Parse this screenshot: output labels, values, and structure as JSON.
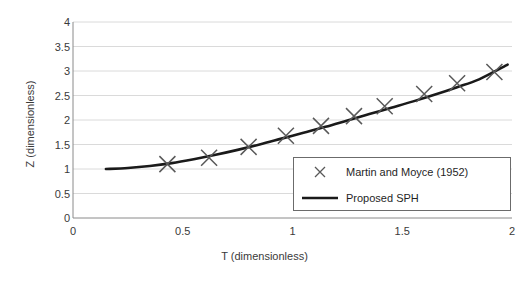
{
  "chart_data": {
    "type": "scatter",
    "title": "",
    "xlabel": "T (dimensionless)",
    "ylabel": "Z (dimensionless)",
    "xlim": [
      0,
      2
    ],
    "ylim": [
      0,
      4
    ],
    "xticks": [
      "0",
      "0.5",
      "1",
      "1.5",
      "2"
    ],
    "xtick_values": [
      0,
      0.5,
      1,
      1.5,
      2
    ],
    "yticks": [
      "0",
      "0.5",
      "1",
      "1.5",
      "2",
      "2.5",
      "3",
      "3.5",
      "4"
    ],
    "ytick_values": [
      0,
      0.5,
      1,
      1.5,
      2,
      2.5,
      3,
      3.5,
      4
    ],
    "grid": true,
    "grid_axis": "y",
    "legend_position": "lower right",
    "series": [
      {
        "name": "Martin and Moyce (1952)",
        "marker": "x",
        "style": "markers",
        "color": "#595959",
        "x": [
          0.43,
          0.62,
          0.8,
          0.97,
          1.13,
          1.28,
          1.42,
          1.6,
          1.75,
          1.92
        ],
        "y": [
          1.1,
          1.23,
          1.45,
          1.68,
          1.88,
          2.08,
          2.28,
          2.53,
          2.75,
          2.98
        ]
      },
      {
        "name": "Proposed SPH",
        "marker": "none",
        "style": "line",
        "color": "#1a1a1a",
        "x": [
          0.15,
          0.25,
          0.35,
          0.45,
          0.55,
          0.65,
          0.75,
          0.85,
          0.95,
          1.05,
          1.15,
          1.25,
          1.35,
          1.45,
          1.55,
          1.65,
          1.75,
          1.85,
          1.98
        ],
        "y": [
          1.0,
          1.02,
          1.06,
          1.12,
          1.2,
          1.29,
          1.39,
          1.5,
          1.62,
          1.74,
          1.86,
          1.99,
          2.12,
          2.25,
          2.38,
          2.52,
          2.67,
          2.83,
          3.13
        ]
      }
    ]
  },
  "legend": {
    "entries": [
      {
        "label": "Martin and Moyce (1952)",
        "symbol": "x-marker-icon"
      },
      {
        "label": "Proposed SPH",
        "symbol": "line-swatch-icon"
      }
    ]
  }
}
